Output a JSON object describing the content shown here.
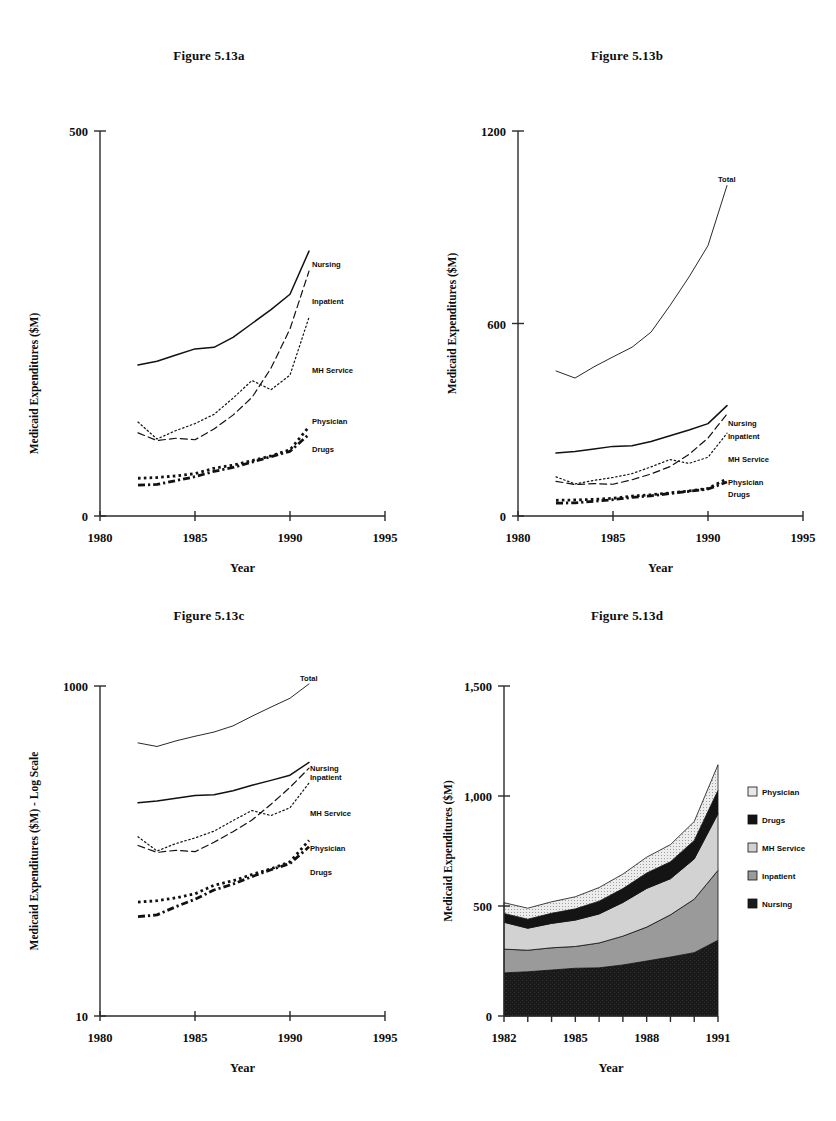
{
  "page": {
    "background": "#ffffff"
  },
  "figures": [
    {
      "id": "fig-a",
      "title": "Figure 5.13a",
      "ylabel": "Medicaid Expenditures ($M)",
      "xlabel": "Year"
    },
    {
      "id": "fig-b",
      "title": "Figure 5.13b",
      "ylabel": "Medicaid Expenditures ($M)",
      "xlabel": "Year"
    },
    {
      "id": "fig-c",
      "title": "Figure 5.13c",
      "ylabel": "Medicaid Expenditures ($M) - Log Scale",
      "xlabel": "Year"
    },
    {
      "id": "fig-d",
      "title": "Figure 5.13d",
      "ylabel": "Medicaid Expenditures ($M)",
      "xlabel": "Year"
    }
  ],
  "series_labels": {
    "nursing": "Nursing",
    "inpatient": "Inpatient",
    "mh_service": "MH Service",
    "physician": "Physician",
    "drugs": "Drugs",
    "total": "Total"
  },
  "legend_d": {
    "items": [
      {
        "label": "Physician",
        "swatch": "#e8e8e8"
      },
      {
        "label": "Drugs",
        "swatch": "#141414"
      },
      {
        "label": "MH Service",
        "swatch": "#d2d2d2"
      },
      {
        "label": "Inpatient",
        "swatch": "#9a9a9a"
      },
      {
        "label": "Nursing",
        "swatch": "#1a1a1a"
      }
    ]
  },
  "chart_data": [
    {
      "type": "line",
      "id": "fig-a",
      "title": "Figure 5.13a",
      "xlabel": "Year",
      "ylabel": "Medicaid Expenditures ($M)",
      "xlim": [
        1980,
        1995
      ],
      "ylim": [
        0,
        500
      ],
      "xticks": [
        1980,
        1985,
        1990,
        1995
      ],
      "xticklabels": [
        "1980",
        "1985",
        "1990",
        "1995"
      ],
      "yticks": [
        0,
        500
      ],
      "yticklabels": [
        "0",
        "500"
      ],
      "grid": false,
      "legend": "inline-right-labels",
      "x": [
        1982,
        1983,
        1984,
        1985,
        1986,
        1987,
        1988,
        1989,
        1990,
        1991
      ],
      "series": [
        {
          "name": "Nursing",
          "style": "solid",
          "values": [
            196,
            201,
            209,
            217,
            219,
            232,
            250,
            268,
            288,
            344
          ]
        },
        {
          "name": "Inpatient",
          "style": "dashed",
          "values": [
            108,
            98,
            101,
            99,
            113,
            131,
            154,
            192,
            243,
            318
          ]
        },
        {
          "name": "MH Service",
          "style": "dash-dot-dot",
          "values": [
            122,
            100,
            111,
            120,
            132,
            153,
            176,
            164,
            183,
            258
          ]
        },
        {
          "name": "Physician",
          "style": "dotted-thick",
          "values": [
            49,
            50,
            52,
            55,
            62,
            66,
            72,
            78,
            86,
            116
          ]
        },
        {
          "name": "Drugs",
          "style": "dash-dot-thick",
          "values": [
            40,
            41,
            46,
            51,
            58,
            63,
            70,
            77,
            84,
            106
          ]
        }
      ]
    },
    {
      "type": "line",
      "id": "fig-b",
      "title": "Figure 5.13b",
      "xlabel": "Year",
      "ylabel": "Medicaid Expenditures ($M)",
      "xlim": [
        1980,
        1995
      ],
      "ylim": [
        0,
        1200
      ],
      "xticks": [
        1980,
        1985,
        1990,
        1995
      ],
      "xticklabels": [
        "1980",
        "1985",
        "1990",
        "1995"
      ],
      "yticks": [
        0,
        600,
        1200
      ],
      "yticklabels": [
        "0",
        "600",
        "1200"
      ],
      "grid": false,
      "legend": "inline-right-labels",
      "x": [
        1982,
        1983,
        1984,
        1985,
        1986,
        1987,
        1988,
        1989,
        1990,
        1991
      ],
      "series": [
        {
          "name": "Total",
          "style": "thin-solid",
          "values": [
            452,
            430,
            465,
            496,
            526,
            573,
            656,
            745,
            843,
            1030
          ]
        },
        {
          "name": "Nursing",
          "style": "solid",
          "values": [
            196,
            201,
            209,
            217,
            219,
            232,
            250,
            268,
            288,
            344
          ]
        },
        {
          "name": "Inpatient",
          "style": "dashed",
          "values": [
            108,
            98,
            101,
            99,
            113,
            131,
            154,
            192,
            243,
            318
          ]
        },
        {
          "name": "MH Service",
          "style": "dash-dot-dot",
          "values": [
            122,
            100,
            111,
            120,
            132,
            153,
            176,
            164,
            183,
            258
          ]
        },
        {
          "name": "Physician",
          "style": "dotted-thick",
          "values": [
            49,
            50,
            52,
            55,
            62,
            66,
            72,
            78,
            86,
            116
          ]
        },
        {
          "name": "Drugs",
          "style": "dash-dot-thick",
          "values": [
            40,
            41,
            46,
            51,
            58,
            63,
            70,
            77,
            84,
            106
          ]
        }
      ]
    },
    {
      "type": "line",
      "id": "fig-c",
      "title": "Figure 5.13c",
      "xlabel": "Year",
      "ylabel": "Medicaid Expenditures ($M) - Log Scale",
      "xlim": [
        1980,
        1995
      ],
      "ylim": [
        10,
        1000
      ],
      "yscale": "log",
      "xticks": [
        1980,
        1985,
        1990,
        1995
      ],
      "xticklabels": [
        "1980",
        "1985",
        "1990",
        "1995"
      ],
      "yticks": [
        10,
        1000
      ],
      "yticklabels": [
        "10",
        "1000"
      ],
      "grid": false,
      "legend": "inline-right-labels",
      "x": [
        1982,
        1983,
        1984,
        1985,
        1986,
        1987,
        1988,
        1989,
        1990,
        1991
      ],
      "series": [
        {
          "name": "Total",
          "style": "thin-solid",
          "values": [
            452,
            430,
            465,
            496,
            526,
            573,
            656,
            745,
            843,
            1030
          ]
        },
        {
          "name": "Nursing",
          "style": "solid",
          "values": [
            196,
            201,
            209,
            217,
            219,
            232,
            250,
            268,
            288,
            344
          ]
        },
        {
          "name": "Inpatient",
          "style": "dashed",
          "values": [
            108,
            98,
            101,
            99,
            113,
            131,
            154,
            192,
            243,
            318
          ]
        },
        {
          "name": "MH Service",
          "style": "dash-dot-dot",
          "values": [
            122,
            100,
            111,
            120,
            132,
            153,
            176,
            164,
            183,
            258
          ]
        },
        {
          "name": "Physician",
          "style": "dotted-thick",
          "values": [
            49,
            50,
            52,
            55,
            62,
            66,
            72,
            78,
            86,
            116
          ]
        },
        {
          "name": "Drugs",
          "style": "dash-dot-thick",
          "values": [
            40,
            41,
            46,
            51,
            58,
            63,
            70,
            77,
            84,
            106
          ]
        }
      ]
    },
    {
      "type": "area",
      "id": "fig-d",
      "title": "Figure 5.13d",
      "xlabel": "Year",
      "ylabel": "Medicaid Expenditures ($M)",
      "xlim": [
        1982,
        1991
      ],
      "ylim": [
        0,
        1500
      ],
      "stacked": true,
      "xticks": [
        1982,
        1983,
        1984,
        1985,
        1986,
        1987,
        1988,
        1989,
        1990,
        1991
      ],
      "xticklabels": [
        "1982",
        "",
        "",
        "1985",
        "",
        "",
        "1988",
        "",
        "",
        "1991"
      ],
      "yticks": [
        0,
        500,
        1000,
        1500
      ],
      "yticklabels": [
        "0",
        "500",
        "1,000",
        "1,500"
      ],
      "grid": false,
      "legend": "right",
      "x": [
        1982,
        1983,
        1984,
        1985,
        1986,
        1987,
        1988,
        1989,
        1990,
        1991
      ],
      "series": [
        {
          "name": "Nursing",
          "fill": "#1a1a1a",
          "values": [
            196,
            201,
            209,
            217,
            219,
            232,
            250,
            268,
            288,
            344
          ]
        },
        {
          "name": "Inpatient",
          "fill": "#9a9a9a",
          "values": [
            108,
            98,
            101,
            99,
            113,
            131,
            154,
            192,
            243,
            318
          ]
        },
        {
          "name": "MH Service",
          "fill": "#d2d2d2",
          "values": [
            122,
            100,
            111,
            120,
            132,
            153,
            176,
            164,
            183,
            258
          ]
        },
        {
          "name": "Drugs",
          "fill": "#141414",
          "values": [
            40,
            41,
            46,
            51,
            58,
            63,
            70,
            77,
            84,
            106
          ]
        },
        {
          "name": "Physician",
          "fill": "#e8e8e8",
          "values": [
            49,
            50,
            52,
            55,
            62,
            66,
            72,
            78,
            86,
            116
          ]
        }
      ]
    }
  ]
}
